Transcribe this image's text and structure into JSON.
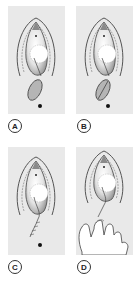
{
  "figure": {
    "panels": [
      {
        "id": "A",
        "label": "A",
        "description": "anatomical diagram with incision and everted oval flap, anal marker below"
      },
      {
        "id": "B",
        "label": "B",
        "description": "anatomical diagram with incision and flap showing central suture line, anal marker below"
      },
      {
        "id": "C",
        "label": "C",
        "description": "anatomical diagram with sutured incision line extending downward, anal marker below"
      },
      {
        "id": "D",
        "label": "D",
        "description": "anatomical diagram with sutured incision and gloved hand performing digital examination"
      }
    ],
    "colors": {
      "panel_background": "#e9e9e9",
      "outline": "#444444",
      "shading": "#9a9a9a",
      "label_border": "#333333"
    }
  }
}
